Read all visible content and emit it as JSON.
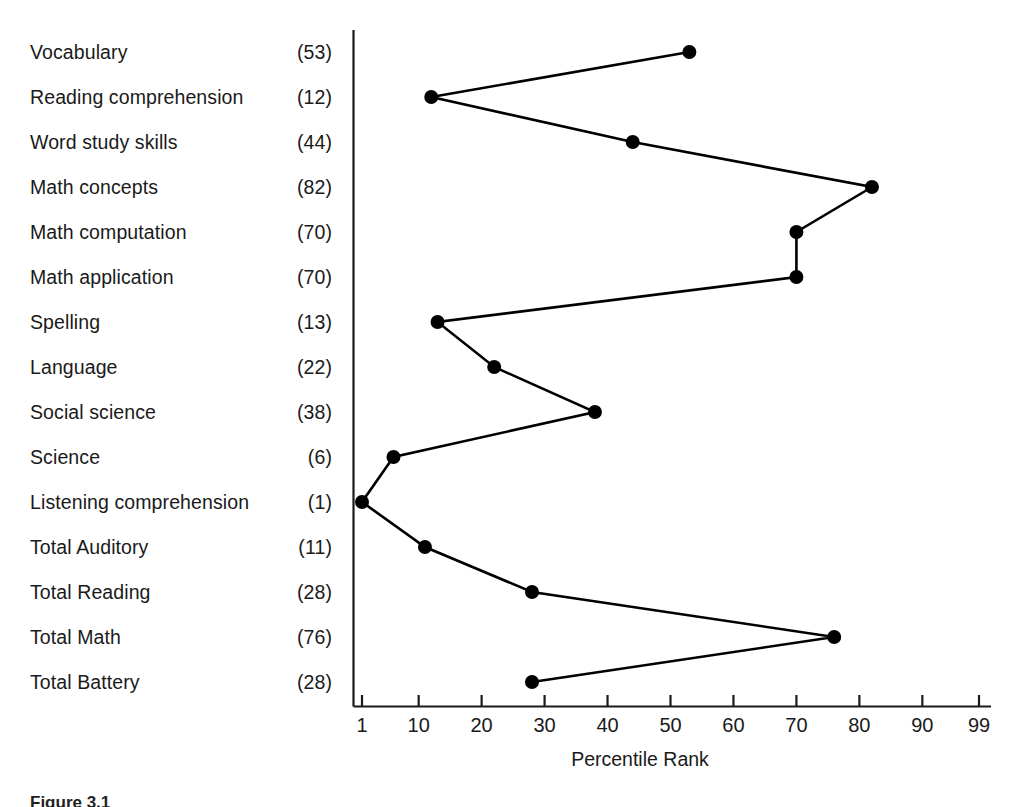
{
  "figure": {
    "caption": "Figure 3.1"
  },
  "chart_data": {
    "type": "line",
    "title": "",
    "xlabel": "Percentile Rank",
    "ylabel": "",
    "orientation": "horizontal",
    "grid": false,
    "legend": "none",
    "xlim": [
      1,
      99
    ],
    "xticks": [
      1,
      10,
      20,
      30,
      40,
      50,
      60,
      70,
      80,
      90,
      99
    ],
    "xtick_labels": [
      "1",
      "10",
      "20",
      "30",
      "40",
      "50",
      "60",
      "70",
      "80",
      "90",
      "99"
    ],
    "categories": [
      "Vocabulary",
      "Reading comprehension",
      "Word study skills",
      "Math concepts",
      "Math computation",
      "Math application",
      "Spelling",
      "Language",
      "Social science",
      "Science",
      "Listening comprehension",
      "Total Auditory",
      "Total Reading",
      "Total Math",
      "Total Battery"
    ],
    "values": [
      53,
      12,
      44,
      82,
      70,
      70,
      13,
      22,
      38,
      6,
      1,
      11,
      28,
      76,
      28
    ],
    "value_labels": [
      "(53)",
      "(12)",
      "(44)",
      "(82)",
      "(70)",
      "(70)",
      "(13)",
      "(22)",
      "(38)",
      "(6)",
      "(1)",
      "(11)",
      "(28)",
      "(76)",
      "(28)"
    ],
    "marker": "filled-circle",
    "line_color": "#000000",
    "marker_color": "#000000"
  }
}
